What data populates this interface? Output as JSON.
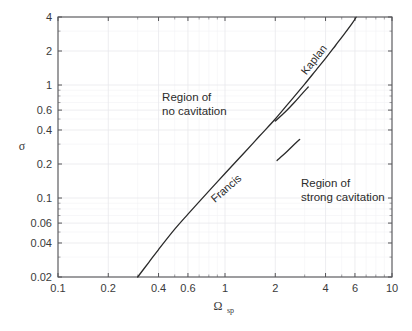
{
  "chart_data": {
    "type": "line",
    "title": "",
    "xlabel": "Ωsp",
    "xlabel_main": "Ω",
    "xlabel_sub": "sp",
    "ylabel": "σ",
    "xscale": "log",
    "yscale": "log",
    "xlim": [
      0.1,
      10
    ],
    "ylim": [
      0.02,
      4
    ],
    "grid": true,
    "legend": "none",
    "xticks": [
      {
        "value": 0.1,
        "label": "0.1"
      },
      {
        "value": 0.2,
        "label": "0.2"
      },
      {
        "value": 0.4,
        "label": "0.4"
      },
      {
        "value": 0.6,
        "label": "0.6"
      },
      {
        "value": 1,
        "label": "1"
      },
      {
        "value": 2,
        "label": "2"
      },
      {
        "value": 4,
        "label": "4"
      },
      {
        "value": 6,
        "label": "6"
      },
      {
        "value": 10,
        "label": "10"
      }
    ],
    "xticks_minor": [
      0.3,
      0.5,
      0.7,
      0.8,
      0.9,
      3,
      5,
      7,
      8,
      9
    ],
    "yticks": [
      {
        "value": 4,
        "label": "4"
      },
      {
        "value": 2,
        "label": "2"
      },
      {
        "value": 1,
        "label": "1"
      },
      {
        "value": 0.6,
        "label": "0.6"
      },
      {
        "value": 0.4,
        "label": "0.4"
      },
      {
        "value": 0.2,
        "label": "0.2"
      },
      {
        "value": 0.1,
        "label": "0.1"
      },
      {
        "value": 0.06,
        "label": "0.06"
      },
      {
        "value": 0.04,
        "label": "0.04"
      },
      {
        "value": 0.02,
        "label": "0.02"
      }
    ],
    "yticks_minor": [
      0.03,
      0.05,
      0.07,
      0.08,
      0.09,
      0.3,
      0.5,
      0.7,
      0.8,
      0.9,
      3
    ],
    "series": [
      {
        "name": "Francis-Kaplan cavitation limit",
        "label": "main-curve",
        "points": [
          [
            0.3,
            0.02
          ],
          [
            0.35,
            0.027
          ],
          [
            0.4,
            0.035
          ],
          [
            0.5,
            0.053
          ],
          [
            0.6,
            0.072
          ],
          [
            0.8,
            0.115
          ],
          [
            1.0,
            0.165
          ],
          [
            1.3,
            0.25
          ],
          [
            1.6,
            0.35
          ],
          [
            2.0,
            0.5
          ],
          [
            2.5,
            0.74
          ],
          [
            3.0,
            1.02
          ],
          [
            3.5,
            1.35
          ],
          [
            4.0,
            1.72
          ],
          [
            4.6,
            2.25
          ],
          [
            5.2,
            2.85
          ],
          [
            5.8,
            3.55
          ],
          [
            6.1,
            3.98
          ]
        ]
      },
      {
        "name": "Francis upper branch",
        "label": "francis-branch",
        "points": [
          [
            2.0,
            0.48
          ],
          [
            2.3,
            0.58
          ],
          [
            2.6,
            0.7
          ],
          [
            2.9,
            0.84
          ],
          [
            3.15,
            0.96
          ]
        ]
      },
      {
        "name": "Kaplan lower branch",
        "label": "kaplan-branch",
        "points": [
          [
            2.05,
            0.215
          ],
          [
            2.3,
            0.25
          ],
          [
            2.55,
            0.29
          ],
          [
            2.8,
            0.33
          ]
        ]
      }
    ],
    "curve_labels": [
      {
        "text": "Francis",
        "x": 1.05,
        "y": 0.115,
        "rotation": -41
      },
      {
        "text": "Kaplan",
        "x": 3.55,
        "y": 1.6,
        "rotation": -52
      }
    ],
    "annotations": [
      {
        "text_line1": "Region of",
        "text_line2": "no cavitation",
        "x": 0.42,
        "y": 0.72
      },
      {
        "text_line1": "Region of",
        "text_line2": "strong cavitation",
        "x": 2.85,
        "y": 0.125
      }
    ]
  },
  "colors": {
    "curve": "#2a2a2a",
    "frame": "#555558",
    "grid_major": "#e8e8ec",
    "grid_minor": "#f2f2f5",
    "text": "#2b2b2b",
    "background": "#ffffff"
  },
  "annotation_region_no_cav_line1": "Region of",
  "annotation_region_no_cav_line2": "no cavitation",
  "annotation_region_strong_cav_line1": "Region of",
  "annotation_region_strong_cav_line2": "strong cavitation",
  "curve_label_francis": "Francis",
  "curve_label_kaplan": "Kaplan",
  "y_axis_title": "σ",
  "x_axis_title_main": "Ω",
  "x_axis_title_sub": "sp"
}
